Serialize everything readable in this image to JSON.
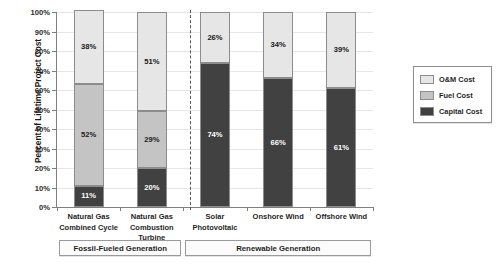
{
  "chart_data": {
    "type": "bar",
    "stacked": true,
    "title": "",
    "xlabel": "",
    "ylabel": "Percent of Lifetime Project Cost",
    "ylim": [
      0,
      100
    ],
    "ytick_labels": [
      "100%",
      "90%",
      "80%",
      "70%",
      "60%",
      "50%",
      "40%",
      "30%",
      "20%",
      "10%",
      "0%"
    ],
    "ytick_values": [
      100,
      90,
      80,
      70,
      60,
      50,
      40,
      30,
      20,
      10,
      0
    ],
    "grid": true,
    "legend_position": "right",
    "categories": [
      "Natural Gas Combined Cycle",
      "Natural Gas Combustion Turbine",
      "Solar Photovoltaic",
      "Onshore Wind",
      "Offshore Wind"
    ],
    "category_lines": [
      [
        "Natural Gas",
        "Combined Cycle"
      ],
      [
        "Natural Gas",
        "Combustion Turbine"
      ],
      [
        "Solar Photovoltaic"
      ],
      [
        "Onshore Wind"
      ],
      [
        "Offshore Wind"
      ]
    ],
    "series": [
      {
        "name": "Capital Cost",
        "color": "#414141",
        "values": [
          11,
          20,
          74,
          66,
          61
        ],
        "labels": [
          "11%",
          "20%",
          "74%",
          "66%",
          "61%"
        ]
      },
      {
        "name": "Fuel Cost",
        "color": "#c4c4c4",
        "values": [
          52,
          29,
          0,
          0,
          0
        ],
        "labels": [
          "52%",
          "29%",
          "",
          "",
          ""
        ]
      },
      {
        "name": "O&M Cost",
        "color": "#e6e6e6",
        "values": [
          38,
          51,
          26,
          34,
          39
        ],
        "labels": [
          "38%",
          "51%",
          "26%",
          "34%",
          "39%"
        ]
      }
    ],
    "legend_entries": [
      {
        "label": "O&M Cost",
        "color": "#e6e6e6"
      },
      {
        "label": "Fuel Cost",
        "color": "#c4c4c4"
      },
      {
        "label": "Capital Cost",
        "color": "#414141"
      }
    ],
    "group_annotations": [
      {
        "label": "Fossil-Fueled Generation",
        "categories": [
          "Natural Gas Combined Cycle",
          "Natural Gas Combustion Turbine"
        ]
      },
      {
        "label": "Renewable Generation",
        "categories": [
          "Solar Photovoltaic",
          "Onshore Wind",
          "Offshore Wind"
        ]
      }
    ],
    "divider": {
      "style": "dashed",
      "between": [
        "Natural Gas Combustion Turbine",
        "Solar Photovoltaic"
      ]
    }
  }
}
